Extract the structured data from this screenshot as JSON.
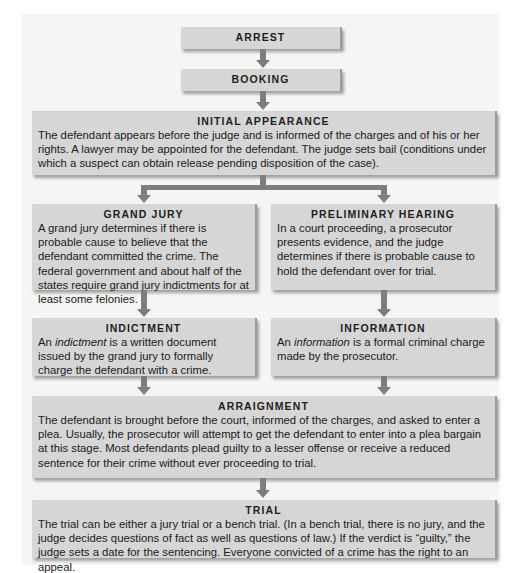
{
  "diagram": {
    "type": "flowchart",
    "colors": {
      "box_fill": "#d6d6d6",
      "arrow": "#7d7d7d",
      "panel": "#f5f5f4"
    },
    "nodes": {
      "arrest": {
        "title": "ARREST"
      },
      "booking": {
        "title": "BOOKING"
      },
      "initial_appearance": {
        "title": "INITIAL APPEARANCE",
        "text": "The defendant appears before the judge and is informed of the charges and of his or her rights. A lawyer may be appointed for the defendant. The judge sets bail (conditions under which a suspect can obtain release pending disposition of the case)."
      },
      "grand_jury": {
        "title": "GRAND JURY",
        "text": "A grand jury determines if there is probable cause to believe that the defendant committed the crime. The federal government and about half of the states require grand jury indictments for at least some felonies."
      },
      "preliminary_hearing": {
        "title": "PRELIMINARY HEARING",
        "text": "In a court proceeding, a prosecutor presents evidence, and the judge determines if there is probable cause to hold the defendant over for trial."
      },
      "indictment": {
        "title": "INDICTMENT",
        "text_prefix": "An ",
        "text_term": "indictment",
        "text_rest": " is a written document issued by the grand jury to formally charge the defendant with a crime."
      },
      "information": {
        "title": "INFORMATION",
        "text_prefix": "An ",
        "text_term": "information",
        "text_rest": " is a formal criminal charge made by the prosecutor."
      },
      "arraignment": {
        "title": "ARRAIGNMENT",
        "text": "The defendant is brought before the court, informed of the charges, and asked to enter a plea. Usually, the prosecutor will attempt to get the defendant to enter into a plea bargain at this stage. Most defendants plead guilty to a lesser offense or receive a reduced sentence for their crime without ever proceeding to trial."
      },
      "trial": {
        "title": "TRIAL",
        "text": "The trial can be either a jury trial or a bench trial. (In a bench trial, there is no jury, and the judge decides questions of fact as well as questions of law.) If the verdict is “guilty,” the judge sets a date for the sentencing. Everyone convicted of a crime has the right to an appeal."
      }
    },
    "edges": [
      [
        "arrest",
        "booking"
      ],
      [
        "booking",
        "initial_appearance"
      ],
      [
        "initial_appearance",
        "grand_jury"
      ],
      [
        "initial_appearance",
        "preliminary_hearing"
      ],
      [
        "grand_jury",
        "indictment"
      ],
      [
        "preliminary_hearing",
        "information"
      ],
      [
        "indictment",
        "arraignment"
      ],
      [
        "information",
        "arraignment"
      ],
      [
        "arraignment",
        "trial"
      ]
    ]
  }
}
